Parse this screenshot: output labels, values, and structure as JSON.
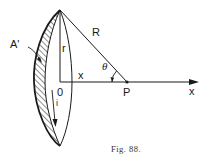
{
  "figure": {
    "caption": "Fig. 88.",
    "labels": {
      "area": "A'",
      "radius": "r",
      "distance": "x",
      "slant": "R",
      "angle": "θ",
      "point": "P",
      "axis": "x",
      "origin": "0",
      "current": "i"
    },
    "colors": {
      "ink": "#1a1a1a",
      "background": "#ffffff"
    }
  }
}
